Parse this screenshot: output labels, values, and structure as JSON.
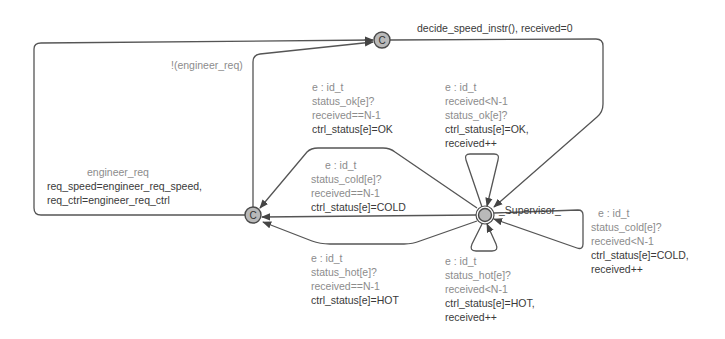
{
  "diagram": {
    "type": "UPPAAL timed automaton",
    "locations": [
      {
        "id": "top_committed",
        "label": "C",
        "kind": "committed"
      },
      {
        "id": "left_committed",
        "label": "C",
        "kind": "committed"
      },
      {
        "id": "supervisor",
        "name": "_Supervisor_",
        "kind": "initial"
      }
    ],
    "edges": {
      "top_to_supervisor": {
        "update": "decide_speed_instr(),  received=0"
      },
      "left_to_top_no_req": {
        "guard": "!(engineer_req)"
      },
      "left_to_top_req": {
        "guard": "engineer_req",
        "update_lines": [
          "req_speed=engineer_req_speed,",
          "req_ctrl=engineer_req_ctrl"
        ]
      },
      "sup_ok_final": {
        "select": "e : id_t",
        "sync": "status_ok[e]?",
        "guard": "received==N-1",
        "update": "ctrl_status[e]=OK"
      },
      "sup_ok_loop": {
        "select": "e : id_t",
        "guard": "received<N-1",
        "sync": "status_ok[e]?",
        "update_lines": [
          "ctrl_status[e]=OK,",
          "received++"
        ]
      },
      "sup_cold_final": {
        "select": "e : id_t",
        "sync": "status_cold[e]?",
        "guard": "received==N-1",
        "update": "ctrl_status[e]=COLD"
      },
      "sup_cold_loop": {
        "select": "e : id_t",
        "sync": "status_cold[e]?",
        "guard": "received<N-1",
        "update_lines": [
          "ctrl_status[e]=COLD,",
          "received++"
        ]
      },
      "sup_hot_final": {
        "select": "e : id_t",
        "sync": "status_hot[e]?",
        "guard": "received==N-1",
        "update": "ctrl_status[e]=HOT"
      },
      "sup_hot_loop": {
        "select": "e : id_t",
        "sync": "status_hot[e]?",
        "guard": "received<N-1",
        "update_lines": [
          "ctrl_status[e]=HOT,",
          "received++"
        ]
      }
    },
    "colors": {
      "edge": "#555555",
      "node_fill": "#b9b9b9",
      "node_stroke": "#4a4a4a",
      "guard_text": "#8c8c8c",
      "update_text": "#3a3a3a"
    }
  }
}
